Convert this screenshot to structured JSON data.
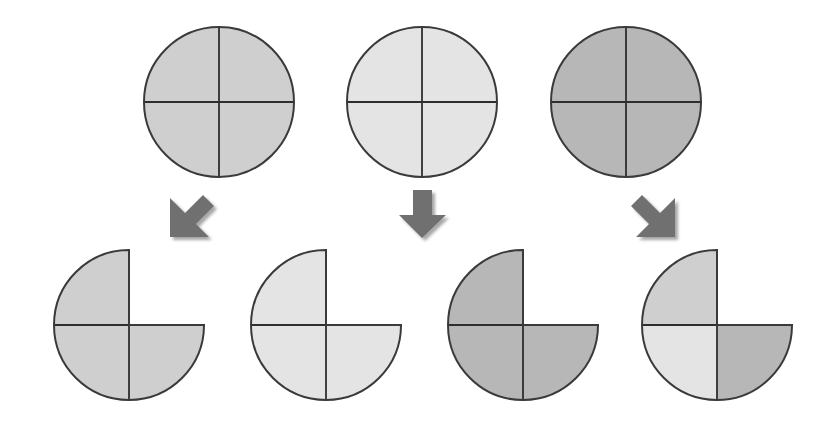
{
  "diagram": {
    "colors": {
      "medium": "#cfcfcf",
      "light": "#e4e4e4",
      "dark": "#b7b7b7",
      "outline": "#3a3a3a",
      "arrow": "#707070",
      "arrow_shadow": "#bdbdbd"
    },
    "sources": [
      {
        "id": "source-medium",
        "shade": "medium",
        "cx": 219,
        "cy": 102,
        "r": 75
      },
      {
        "id": "source-light",
        "shade": "light",
        "cx": 422,
        "cy": 102,
        "r": 75
      },
      {
        "id": "source-dark",
        "shade": "dark",
        "cx": 626,
        "cy": 102,
        "r": 75
      }
    ],
    "arrows": [
      {
        "id": "arrow-down-left",
        "direction": "down-left"
      },
      {
        "id": "arrow-down",
        "direction": "down"
      },
      {
        "id": "arrow-down-right",
        "direction": "down-right"
      }
    ],
    "results": [
      {
        "id": "result-medium",
        "cx": 129,
        "cy": 325,
        "r": 75,
        "quadrants": {
          "top_left": "medium",
          "bottom_left": "medium",
          "bottom_right": "medium"
        },
        "missing": "top_right"
      },
      {
        "id": "result-light",
        "cx": 326,
        "cy": 325,
        "r": 75,
        "quadrants": {
          "top_left": "light",
          "bottom_left": "light",
          "bottom_right": "light"
        },
        "missing": "top_right"
      },
      {
        "id": "result-dark",
        "cx": 523,
        "cy": 325,
        "r": 75,
        "quadrants": {
          "top_left": "dark",
          "bottom_left": "dark",
          "bottom_right": "dark"
        },
        "missing": "top_right"
      },
      {
        "id": "result-mixed",
        "cx": 717,
        "cy": 325,
        "r": 75,
        "quadrants": {
          "top_left": "medium",
          "bottom_left": "light",
          "bottom_right": "dark"
        },
        "missing": "top_right"
      }
    ]
  }
}
